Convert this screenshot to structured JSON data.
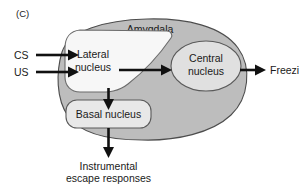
{
  "figure": {
    "panel_label": "(C)",
    "background_color": "#ffffff",
    "width": 299,
    "height": 186
  },
  "colors": {
    "amygdala_fill": "#bdbdbd",
    "amygdala_stroke": "#4d4d4d",
    "lateral_fill": "#f7f7f7",
    "central_fill": "#e0e0e0",
    "basal_fill": "#e8e8e8",
    "node_stroke": "#5a5a5a",
    "arrow_color": "#111111",
    "text_color": "#1a1a1a"
  },
  "regions": {
    "amygdala": {
      "label": "Amygdala"
    }
  },
  "nodes": {
    "lateral": {
      "label_line1": "Lateral",
      "label_line2": "nucleus"
    },
    "central": {
      "label_line1": "Central",
      "label_line2": "nucleus"
    },
    "basal": {
      "label": "Basal nucleus"
    }
  },
  "inputs": [
    {
      "label": "CS"
    },
    {
      "label": "US"
    }
  ],
  "outputs": [
    {
      "label": "Freezing"
    },
    {
      "label_line1": "Instrumental",
      "label_line2": "escape responses"
    }
  ],
  "connections": [
    {
      "from": "CS",
      "to": "lateral"
    },
    {
      "from": "US",
      "to": "lateral"
    },
    {
      "from": "lateral",
      "to": "central"
    },
    {
      "from": "lateral",
      "to": "basal"
    },
    {
      "from": "central",
      "to": "Freezing"
    },
    {
      "from": "basal",
      "to": "Instrumental escape responses"
    }
  ]
}
